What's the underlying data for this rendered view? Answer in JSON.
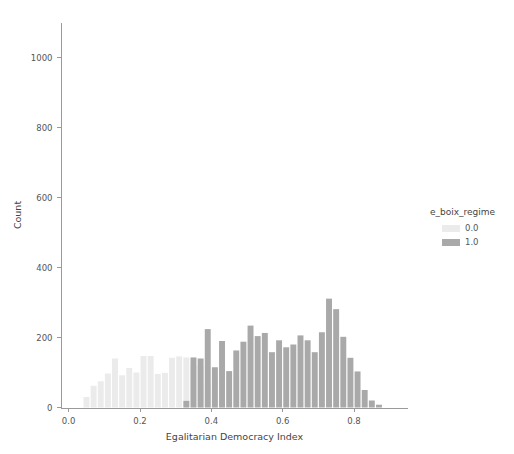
{
  "chart_data": {
    "type": "bar",
    "title": "",
    "subtitle": "",
    "xlabel": "Egalitarian Democracy Index",
    "ylabel": "Count",
    "xlim": [
      -0.02,
      0.95
    ],
    "ylim": [
      0,
      1100
    ],
    "xticks": [
      0.0,
      0.2,
      0.4,
      0.6,
      0.8
    ],
    "xtick_labels": [
      "0.0",
      "0.2",
      "0.4",
      "0.6",
      "0.8"
    ],
    "yticks": [
      0,
      200,
      400,
      600,
      800,
      1000
    ],
    "ytick_labels": [
      "0",
      "200",
      "400",
      "600",
      "800",
      "1000"
    ],
    "grid": false,
    "bin_width": 0.02,
    "legend": {
      "title": "e_boix_regime",
      "position": "right",
      "entries": [
        {
          "label": "0.0",
          "color": "#ebebeb"
        },
        {
          "label": "1.0",
          "color": "#a9a9a9"
        }
      ]
    },
    "series": [
      {
        "name": "0.0",
        "color": "#ebebeb",
        "bins": [
          0.05,
          0.07,
          0.09,
          0.11,
          0.13,
          0.15,
          0.17,
          0.19,
          0.21,
          0.23,
          0.25,
          0.27,
          0.29,
          0.31,
          0.33,
          0.35,
          0.37,
          0.39,
          0.41,
          0.43
        ],
        "values": [
          30,
          62,
          75,
          97,
          140,
          92,
          113,
          100,
          147,
          147,
          96,
          99,
          142,
          146,
          143,
          122,
          119,
          65,
          80,
          22
        ]
      },
      {
        "name": "1.0",
        "color": "#a9a9a9",
        "bins": [
          0.33,
          0.35,
          0.37,
          0.39,
          0.41,
          0.43,
          0.45,
          0.47,
          0.49,
          0.51,
          0.53,
          0.55,
          0.57,
          0.59,
          0.61,
          0.63,
          0.65,
          0.67,
          0.69,
          0.71,
          0.73,
          0.75,
          0.77,
          0.79,
          0.81,
          0.83,
          0.85,
          0.87
        ],
        "values": [
          19,
          143,
          140,
          224,
          115,
          190,
          104,
          163,
          188,
          234,
          204,
          213,
          158,
          192,
          172,
          180,
          206,
          192,
          158,
          215,
          311,
          281,
          202,
          142,
          103,
          50,
          20,
          8
        ]
      }
    ]
  },
  "footer": {
    "remnant": ""
  }
}
